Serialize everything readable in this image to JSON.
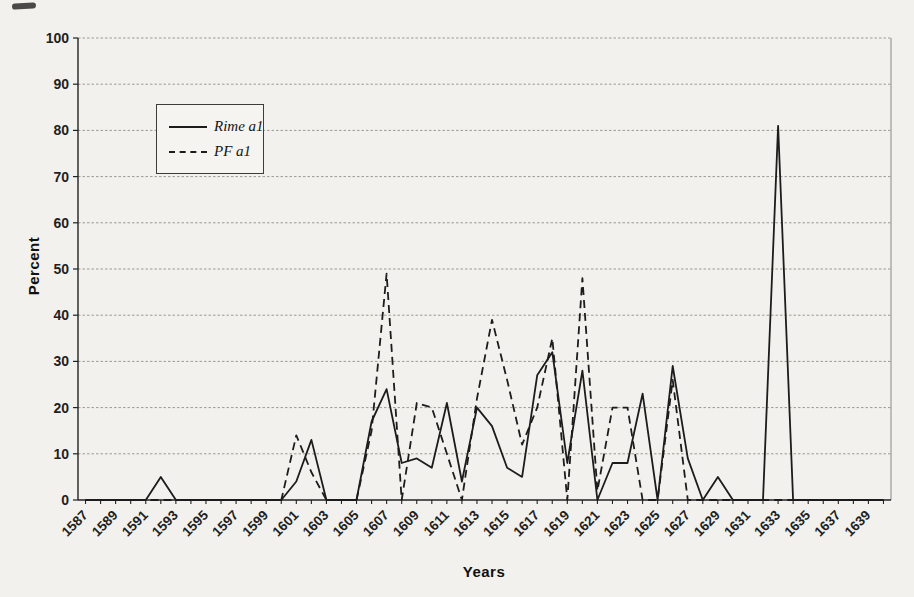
{
  "page": {
    "background": "#f2f1ed"
  },
  "legend": {
    "items": [
      {
        "label": "Rime a1",
        "line_style": "solid"
      },
      {
        "label": "PF a1",
        "line_style": "dashed"
      }
    ]
  },
  "chart_data": {
    "type": "line",
    "title": "",
    "xlabel": "Years",
    "ylabel": "Percent",
    "ylim": [
      0,
      100
    ],
    "yticks": [
      0,
      10,
      20,
      30,
      40,
      50,
      60,
      70,
      80,
      90,
      100
    ],
    "grid": "horizontal",
    "legend_position": "upper-left-inside",
    "x_tick_labels": [
      1587,
      1589,
      1591,
      1593,
      1595,
      1597,
      1599,
      1601,
      1603,
      1605,
      1607,
      1609,
      1611,
      1613,
      1615,
      1617,
      1619,
      1621,
      1623,
      1625,
      1627,
      1629,
      1631,
      1633,
      1635,
      1637,
      1639
    ],
    "categories": [
      1587,
      1588,
      1589,
      1590,
      1591,
      1592,
      1593,
      1594,
      1595,
      1596,
      1597,
      1598,
      1599,
      1600,
      1601,
      1602,
      1603,
      1604,
      1605,
      1606,
      1607,
      1608,
      1609,
      1610,
      1611,
      1612,
      1613,
      1614,
      1615,
      1616,
      1617,
      1618,
      1619,
      1620,
      1621,
      1622,
      1623,
      1624,
      1625,
      1626,
      1627,
      1628,
      1629,
      1630,
      1631,
      1632,
      1633,
      1634,
      1635,
      1636,
      1637,
      1638,
      1639,
      1640
    ],
    "series": [
      {
        "name": "Rime a1",
        "style": "solid",
        "color": "#1c1c1c",
        "values": [
          0,
          0,
          0,
          0,
          0,
          5,
          0,
          0,
          0,
          0,
          0,
          0,
          0,
          0,
          4,
          13,
          0,
          0,
          0,
          17,
          24,
          8,
          9,
          7,
          21,
          4,
          20,
          16,
          7,
          5,
          27,
          32,
          8,
          28,
          0,
          8,
          8,
          23,
          0,
          29,
          9,
          0,
          5,
          0,
          0,
          0,
          81,
          0,
          0,
          0,
          0,
          0,
          0,
          0
        ]
      },
      {
        "name": "PF a1",
        "style": "dashed",
        "color": "#1c1c1c",
        "values": [
          0,
          0,
          0,
          0,
          0,
          0,
          0,
          0,
          0,
          0,
          0,
          0,
          0,
          0,
          14,
          6,
          0,
          0,
          0,
          15,
          49,
          0,
          21,
          20,
          10,
          0,
          22,
          39,
          26,
          12,
          20,
          35,
          0,
          48,
          2,
          20,
          20,
          0,
          0,
          26,
          0,
          0,
          0,
          0,
          0,
          0,
          0,
          0,
          0,
          0,
          0,
          0,
          0,
          0
        ]
      }
    ]
  }
}
